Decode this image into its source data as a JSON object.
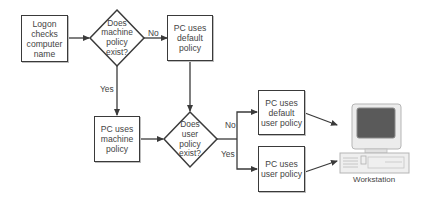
{
  "diagram": {
    "type": "flowchart",
    "nodes": [
      {
        "id": "logon",
        "shape": "rect",
        "text": "Logon checks computer name"
      },
      {
        "id": "machine_policy_q",
        "shape": "diamond",
        "text": "Does machine policy exist?"
      },
      {
        "id": "default_policy",
        "shape": "rect",
        "text": "PC uses default policy"
      },
      {
        "id": "machine_policy",
        "shape": "rect",
        "text": "PC uses machine policy"
      },
      {
        "id": "user_policy_q",
        "shape": "diamond",
        "text": "Does user policy exist?"
      },
      {
        "id": "default_user_policy",
        "shape": "rect",
        "text": "PC uses default user policy"
      },
      {
        "id": "user_policy",
        "shape": "rect",
        "text": "PC uses user policy"
      },
      {
        "id": "workstation",
        "shape": "computer-icon",
        "text": "Workstation"
      }
    ],
    "edges": [
      {
        "from": "logon",
        "to": "machine_policy_q",
        "label": ""
      },
      {
        "from": "machine_policy_q",
        "to": "default_policy",
        "label": "No"
      },
      {
        "from": "machine_policy_q",
        "to": "machine_policy",
        "label": "Yes"
      },
      {
        "from": "default_policy",
        "to": "user_policy_q",
        "label": ""
      },
      {
        "from": "machine_policy",
        "to": "user_policy_q",
        "label": ""
      },
      {
        "from": "user_policy_q",
        "to": "default_user_policy",
        "label": "No"
      },
      {
        "from": "user_policy_q",
        "to": "user_policy",
        "label": "Yes"
      },
      {
        "from": "default_user_policy",
        "to": "workstation",
        "label": ""
      },
      {
        "from": "user_policy",
        "to": "workstation",
        "label": ""
      }
    ]
  },
  "labels": {
    "logon": "Logon checks computer name",
    "machine_q": "Does machine policy exist?",
    "default_policy": "PC uses default policy",
    "machine_policy": "PC uses machine policy",
    "user_q": "Does user policy exist?",
    "default_user_policy": "PC uses default user policy",
    "user_policy": "PC uses user policy",
    "no_1": "No",
    "yes_1": "Yes",
    "no_2": "No",
    "yes_2": "Yes",
    "workstation": "Workstation"
  },
  "colors": {
    "line": "#3a3a3a",
    "monitor_body": "#e6e6e6",
    "screen": "#5a5a5a"
  }
}
